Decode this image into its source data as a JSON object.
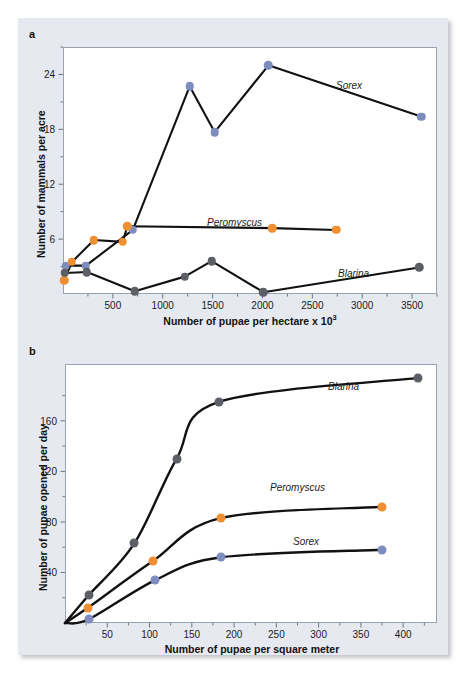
{
  "figure": {
    "panels": [
      {
        "letter": "a",
        "xlabel_text": "Number of pupae per hectare x 10",
        "xlabel_sup": "3",
        "ylabel": "Number of mammals per acre",
        "xticks": [
          "500",
          "1000",
          "1500",
          "2000",
          "2500",
          "3000",
          "3500"
        ],
        "yticks": [
          "6",
          "12",
          "18",
          "24"
        ],
        "series_labels": [
          "Sorex",
          "Peromyscus",
          "Blarina"
        ]
      },
      {
        "letter": "b",
        "xlabel_text": "Number of pupae per square meter",
        "xlabel_sup": "",
        "ylabel": "Number of pupae opened per day",
        "xticks": [
          "50",
          "100",
          "150",
          "200",
          "250",
          "300",
          "350",
          "400"
        ],
        "yticks": [
          "40",
          "80",
          "120",
          "160"
        ],
        "series_labels": [
          "Blarina",
          "Peromyscus",
          "Sorex"
        ]
      }
    ]
  },
  "colors": {
    "blue": "#7d8dbd",
    "orange": "#ef8f33",
    "gray": "#5c6066",
    "line": "#111111",
    "panel_background": "#e6eaf0",
    "plot_background": "#ffffff",
    "frame": "#9aa3ad"
  },
  "chart_data": [
    {
      "type": "line",
      "panel": "a",
      "title": "",
      "xlabel": "Number of pupae per hectare x 10^3",
      "ylabel": "Number of mammals per acre",
      "xlim": [
        0,
        3750
      ],
      "ylim": [
        0,
        27
      ],
      "xticks": [
        500,
        1000,
        1500,
        2000,
        2500,
        3000,
        3500
      ],
      "yticks": [
        6,
        12,
        18,
        24
      ],
      "grid": false,
      "legend": "inline-labels",
      "series": [
        {
          "name": "Sorex",
          "marker_color": "#7d8dbd",
          "x": [
            30,
            230,
            700,
            1270,
            1520,
            2060,
            3590
          ],
          "y": [
            3.1,
            3.1,
            7.0,
            22.7,
            17.7,
            25.0,
            19.4
          ]
        },
        {
          "name": "Peromyscus",
          "marker_color": "#ef8f33",
          "x": [
            10,
            90,
            310,
            600,
            645,
            2100,
            2740
          ],
          "y": [
            1.5,
            3.5,
            5.9,
            5.7,
            7.4,
            7.2,
            7.0
          ]
        },
        {
          "name": "Blarina",
          "marker_color": "#5c6066",
          "x": [
            20,
            240,
            720,
            1220,
            1490,
            2010,
            3570
          ],
          "y": [
            2.3,
            2.4,
            0.3,
            1.9,
            3.6,
            0.2,
            2.9
          ]
        }
      ]
    },
    {
      "type": "line",
      "panel": "b",
      "title": "",
      "xlabel": "Number of pupae per square meter",
      "ylabel": "Number of pupae opened per day",
      "xlim": [
        0,
        440
      ],
      "ylim": [
        0,
        205
      ],
      "xticks": [
        50,
        100,
        150,
        200,
        250,
        300,
        350,
        400
      ],
      "yticks": [
        40,
        80,
        120,
        160
      ],
      "grid": false,
      "legend": "inline-labels",
      "series": [
        {
          "name": "Blarina",
          "marker_color": "#5c6066",
          "x": [
            0,
            28,
            82,
            132,
            182,
            418
          ],
          "y": [
            0,
            22,
            63,
            130,
            175,
            194
          ]
        },
        {
          "name": "Peromyscus",
          "marker_color": "#ef8f33",
          "x": [
            0,
            27,
            104,
            184,
            375
          ],
          "y": [
            0,
            12,
            49,
            83,
            92
          ]
        },
        {
          "name": "Sorex",
          "marker_color": "#7d8dbd",
          "x": [
            0,
            28,
            107,
            185,
            375
          ],
          "y": [
            0,
            3,
            34,
            52,
            58
          ]
        }
      ]
    }
  ]
}
